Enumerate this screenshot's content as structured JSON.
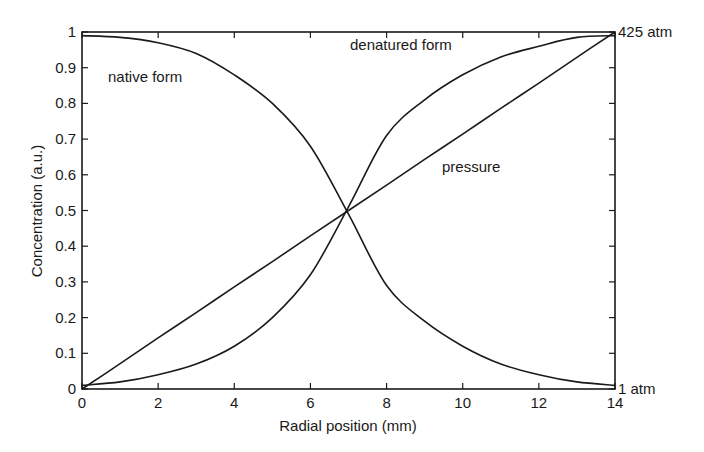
{
  "chart_data": {
    "type": "line",
    "title": "",
    "xlabel": "Radial position (mm)",
    "ylabel": "Concentration (a.u.)",
    "xlim": [
      0,
      14
    ],
    "ylim": [
      0,
      1
    ],
    "grid": false,
    "legend": "none (curves labeled inline)",
    "x_ticks": [
      0,
      2,
      4,
      6,
      8,
      10,
      12,
      14
    ],
    "x_tick_labels": [
      "0",
      "2",
      "4",
      "6",
      "8",
      "10",
      "12",
      "14"
    ],
    "y_ticks": [
      0,
      0.1,
      0.2,
      0.3,
      0.4,
      0.5,
      0.6,
      0.7,
      0.8,
      0.9,
      1
    ],
    "y_tick_labels": [
      "0",
      "0.1",
      "0.2",
      "0.3",
      "0.4",
      "0.5",
      "0.6",
      "0.7",
      "0.8",
      "0.9",
      "1"
    ],
    "right_axis": {
      "label_top": "425 atm",
      "label_bottom": "1 atm",
      "quantity": "pressure"
    },
    "x": [
      0,
      1,
      2,
      3,
      4,
      5,
      6,
      7,
      8,
      9,
      10,
      11,
      12,
      13,
      14
    ],
    "series": [
      {
        "name": "native form",
        "values": [
          0.99,
          0.985,
          0.97,
          0.94,
          0.88,
          0.8,
          0.68,
          0.49,
          0.29,
          0.19,
          0.12,
          0.07,
          0.04,
          0.02,
          0.01
        ]
      },
      {
        "name": "denatured form",
        "values": [
          0.01,
          0.02,
          0.04,
          0.07,
          0.12,
          0.2,
          0.32,
          0.51,
          0.71,
          0.81,
          0.88,
          0.93,
          0.96,
          0.985,
          0.99
        ]
      },
      {
        "name": "pressure",
        "values": [
          0.0,
          0.071,
          0.143,
          0.214,
          0.286,
          0.357,
          0.429,
          0.5,
          0.571,
          0.643,
          0.714,
          0.786,
          0.857,
          0.929,
          1.0
        ]
      }
    ],
    "annotations": [
      {
        "text": "native form",
        "x": 1.0,
        "y": 0.88
      },
      {
        "text": "denatured form",
        "x": 8.5,
        "y": 0.96
      },
      {
        "text": "pressure",
        "x": 9.5,
        "y": 0.62
      }
    ]
  },
  "labels": {
    "native": "native form",
    "denatured": "denatured form",
    "pressure": "pressure",
    "top_right": "425 atm",
    "bottom_right": "1 atm",
    "xlabel": "Radial position (mm)",
    "ylabel": "Concentration (a.u.)"
  },
  "colors": {
    "line": "#1a1a1a",
    "background": "#ffffff"
  }
}
